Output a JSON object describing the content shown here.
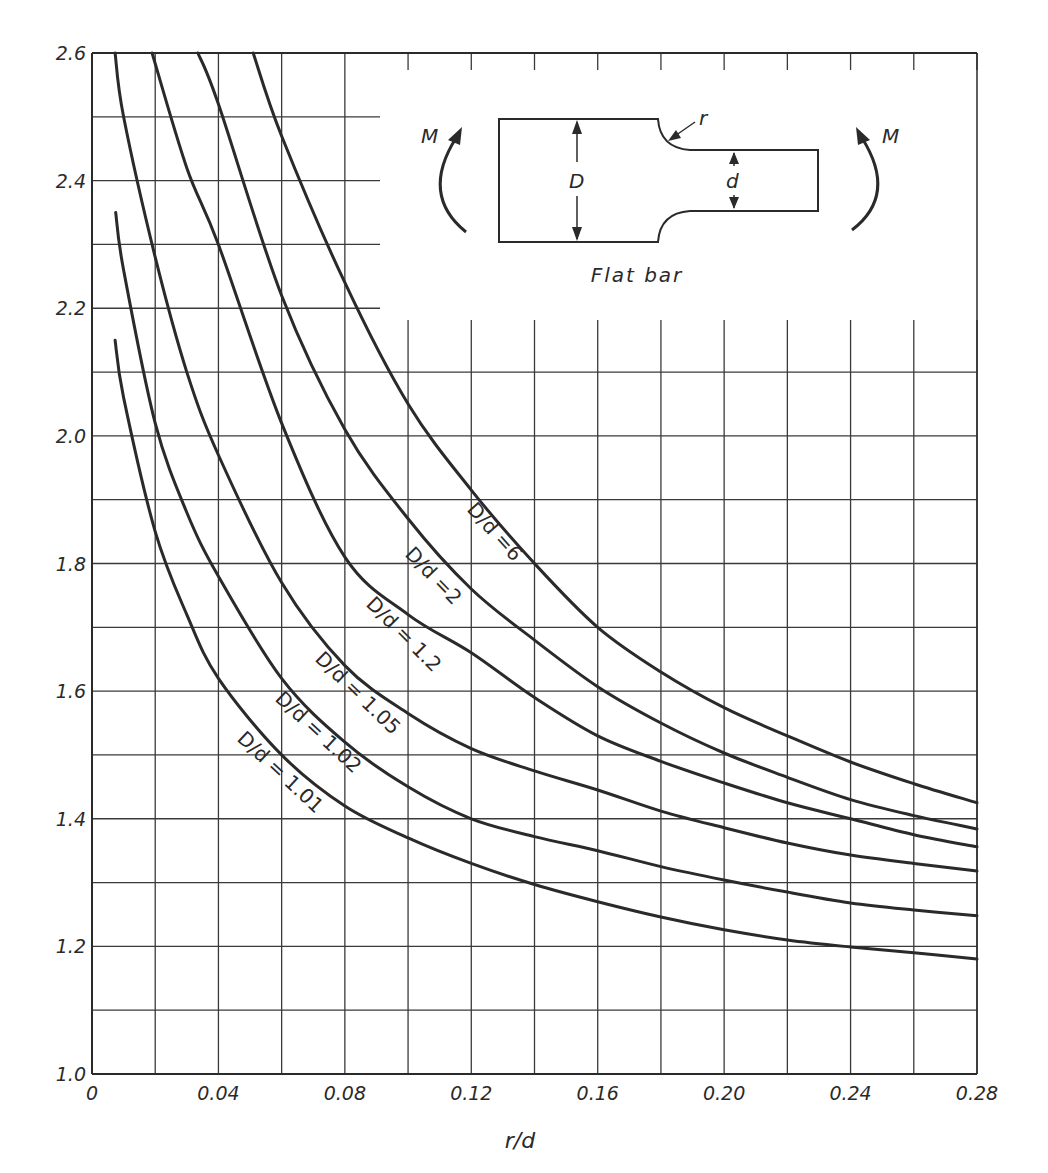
{
  "chart_data": {
    "type": "line",
    "title": "",
    "xlabel": "r/d",
    "ylabel": "",
    "xlim": [
      0,
      0.28
    ],
    "ylim": [
      1.0,
      2.6
    ],
    "grid": true,
    "x_ticks": [
      "0",
      "0.04",
      "0.08",
      "0.12",
      "0.16",
      "0.20",
      "0.24",
      "0.28"
    ],
    "x_tick_values": [
      0,
      0.04,
      0.08,
      0.12,
      0.16,
      0.2,
      0.24,
      0.28
    ],
    "y_ticks": [
      "1.0",
      "1.2",
      "1.4",
      "1.6",
      "1.8",
      "2.0",
      "2.2",
      "2.4",
      "2.6"
    ],
    "y_tick_values": [
      1.0,
      1.2,
      1.4,
      1.6,
      1.8,
      2.0,
      2.2,
      2.4,
      2.6
    ],
    "x_grid_step": 0.02,
    "y_grid_step": 0.1,
    "series": [
      {
        "name": "D/d = 6",
        "label": "D/d =6",
        "x": [
          0.051,
          0.06,
          0.08,
          0.1,
          0.12,
          0.14,
          0.16,
          0.18,
          0.2,
          0.22,
          0.24,
          0.26,
          0.28
        ],
        "y": [
          2.6,
          2.47,
          2.24,
          2.05,
          1.915,
          1.8,
          1.7,
          1.63,
          1.574,
          1.53,
          1.489,
          1.455,
          1.425
        ]
      },
      {
        "name": "D/d = 2",
        "label": "D/d =2",
        "x": [
          0.0335,
          0.04,
          0.06,
          0.08,
          0.1,
          0.12,
          0.14,
          0.16,
          0.18,
          0.2,
          0.22,
          0.24,
          0.26,
          0.28
        ],
        "y": [
          2.6,
          2.52,
          2.22,
          2.01,
          1.87,
          1.76,
          1.68,
          1.607,
          1.55,
          1.503,
          1.465,
          1.43,
          1.405,
          1.384
        ]
      },
      {
        "name": "D/d = 1.2",
        "label": "D/d = 1.2",
        "x": [
          0.019,
          0.03,
          0.04,
          0.06,
          0.08,
          0.1,
          0.12,
          0.14,
          0.16,
          0.18,
          0.2,
          0.22,
          0.24,
          0.26,
          0.28
        ],
        "y": [
          2.6,
          2.42,
          2.3,
          2.02,
          1.81,
          1.72,
          1.66,
          1.59,
          1.53,
          1.49,
          1.456,
          1.425,
          1.4,
          1.375,
          1.356
        ]
      },
      {
        "name": "D/d = 1.05",
        "label": "D/d = 1.05",
        "x": [
          0.0073,
          0.01,
          0.02,
          0.03,
          0.04,
          0.06,
          0.08,
          0.1,
          0.12,
          0.14,
          0.16,
          0.18,
          0.2,
          0.22,
          0.24,
          0.26,
          0.28
        ],
        "y": [
          2.6,
          2.5,
          2.28,
          2.1,
          1.97,
          1.77,
          1.64,
          1.565,
          1.51,
          1.475,
          1.445,
          1.412,
          1.386,
          1.362,
          1.343,
          1.33,
          1.318
        ]
      },
      {
        "name": "D/d = 1.02",
        "label": "D/d = 1.02",
        "x": [
          0.0075,
          0.01,
          0.02,
          0.03,
          0.04,
          0.06,
          0.08,
          0.1,
          0.12,
          0.14,
          0.16,
          0.18,
          0.2,
          0.22,
          0.24,
          0.26,
          0.28
        ],
        "y": [
          2.35,
          2.26,
          2.02,
          1.88,
          1.78,
          1.62,
          1.52,
          1.45,
          1.4,
          1.372,
          1.35,
          1.325,
          1.304,
          1.285,
          1.268,
          1.257,
          1.248
        ]
      },
      {
        "name": "D/d = 1.01",
        "label": "D/d = 1.01",
        "x": [
          0.0073,
          0.01,
          0.02,
          0.03,
          0.04,
          0.06,
          0.08,
          0.1,
          0.12,
          0.14,
          0.16,
          0.18,
          0.2,
          0.22,
          0.24,
          0.26,
          0.28
        ],
        "y": [
          2.15,
          2.06,
          1.85,
          1.72,
          1.62,
          1.5,
          1.42,
          1.37,
          1.33,
          1.297,
          1.27,
          1.246,
          1.226,
          1.21,
          1.199,
          1.19,
          1.18
        ]
      }
    ],
    "inset": {
      "caption": "Flat bar",
      "labels": {
        "moment": "M",
        "large_dim": "D",
        "small_dim": "d",
        "radius": "r"
      }
    }
  }
}
